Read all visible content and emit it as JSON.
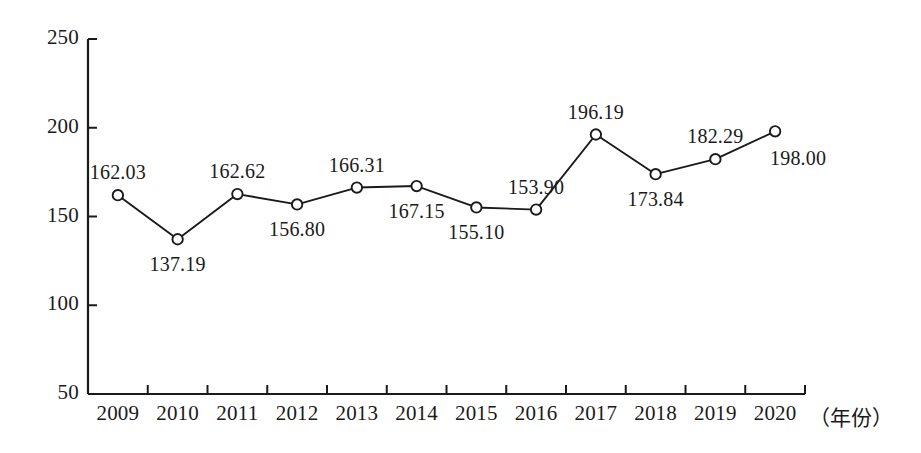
{
  "chart_data": {
    "type": "line",
    "title": "",
    "subtitle": "",
    "xlabel": "（年份）",
    "ylabel": "",
    "categories": [
      "2009",
      "2010",
      "2011",
      "2012",
      "2013",
      "2014",
      "2015",
      "2016",
      "2017",
      "2018",
      "2019",
      "2020"
    ],
    "values": [
      162.03,
      137.19,
      162.62,
      156.8,
      166.31,
      167.15,
      155.1,
      153.9,
      196.19,
      173.84,
      182.29,
      198.0
    ],
    "point_labels": [
      "162.03",
      "137.19",
      "162.62",
      "156.80",
      "166.31",
      "167.15",
      "155.10",
      "153.90",
      "196.19",
      "173.84",
      "182.29",
      "198.00"
    ],
    "label_placement": [
      "above",
      "below",
      "above",
      "below",
      "above",
      "below",
      "below",
      "above",
      "above",
      "below",
      "above",
      "below-right"
    ],
    "ylim": [
      50,
      250
    ],
    "yticks": [
      50,
      100,
      150,
      200,
      250
    ],
    "ytick_labels": [
      "50",
      "100",
      "150",
      "200",
      "250"
    ],
    "grid": false,
    "legend": null,
    "series_color": "#1a1a1a",
    "marker": "open-circle",
    "axis_color": "#1a1a1a",
    "background_color": "#ffffff"
  }
}
